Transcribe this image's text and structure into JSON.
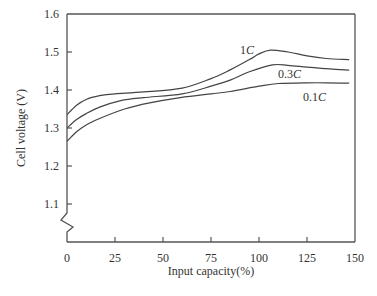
{
  "chart_data": {
    "type": "line",
    "title": "",
    "xlabel": "Input capacity(%)",
    "ylabel": "Cell voltage (V)",
    "xlim": [
      0,
      150
    ],
    "ylim": [
      1.0,
      1.6
    ],
    "xticks": [
      0,
      25,
      50,
      75,
      100,
      125,
      150
    ],
    "xtick_labels": [
      "0",
      "25",
      "50",
      "75",
      "100",
      "125",
      "150"
    ],
    "yticks": [
      1.1,
      1.2,
      1.3,
      1.4,
      1.5,
      1.6
    ],
    "ytick_labels": [
      "1.1",
      "1.2",
      "1.3",
      "1.4",
      "1.5",
      "1.6"
    ],
    "y_axis_break": true,
    "grid": false,
    "legend": "inline labels",
    "series": [
      {
        "name": "1C",
        "label_rate": "1",
        "label_unit": "C",
        "x": [
          0,
          5,
          10,
          17,
          25,
          40,
          60,
          75,
          85,
          95,
          100,
          106,
          115,
          125,
          135,
          147
        ],
        "y": [
          1.335,
          1.36,
          1.375,
          1.385,
          1.39,
          1.395,
          1.405,
          1.43,
          1.453,
          1.48,
          1.495,
          1.505,
          1.5,
          1.49,
          1.483,
          1.48
        ]
      },
      {
        "name": "0.3C",
        "label_rate": "0.3",
        "label_unit": "C",
        "x": [
          0,
          5,
          10,
          17,
          28,
          40,
          60,
          75,
          85,
          95,
          107,
          115,
          125,
          135,
          147
        ],
        "y": [
          1.3,
          1.322,
          1.338,
          1.355,
          1.372,
          1.38,
          1.39,
          1.41,
          1.426,
          1.448,
          1.466,
          1.465,
          1.46,
          1.456,
          1.452
        ]
      },
      {
        "name": "0.1C",
        "label_rate": "0.1",
        "label_unit": "C",
        "x": [
          0,
          5,
          10,
          17,
          30,
          43,
          59,
          75,
          85,
          100,
          110,
          125,
          135,
          147
        ],
        "y": [
          1.265,
          1.29,
          1.308,
          1.325,
          1.35,
          1.366,
          1.38,
          1.39,
          1.396,
          1.41,
          1.417,
          1.419,
          1.419,
          1.418
        ]
      }
    ]
  }
}
